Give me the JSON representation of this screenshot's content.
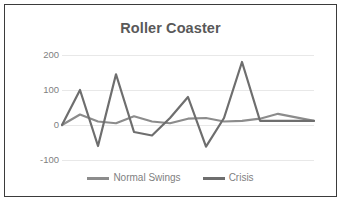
{
  "chart_data": {
    "type": "line",
    "title": "Roller Coaster",
    "xlabel": "",
    "ylabel": "",
    "ylim": [
      -100,
      200
    ],
    "yticks": [
      200,
      100,
      0,
      -100
    ],
    "ytick_labels": [
      "200",
      "100",
      "0",
      "-100"
    ],
    "grid": true,
    "legend_position": "bottom",
    "x": [
      1,
      2,
      3,
      4,
      5,
      6,
      7,
      8,
      9,
      10,
      11,
      12,
      13,
      14,
      15
    ],
    "series": [
      {
        "name": "Normal Swings",
        "color": "#8c8c8c",
        "values": [
          0,
          30,
          10,
          5,
          25,
          10,
          5,
          18,
          20,
          10,
          12,
          18,
          32,
          22,
          12
        ]
      },
      {
        "name": "Crisis",
        "color": "#6e6e6e",
        "values": [
          0,
          100,
          -60,
          145,
          -20,
          -30,
          20,
          80,
          -62,
          20,
          180,
          12,
          12,
          12,
          12
        ]
      }
    ]
  },
  "legend": {
    "entries": [
      {
        "label": "Normal Swings",
        "color": "#8c8c8c"
      },
      {
        "label": "Crisis",
        "color": "#6e6e6e"
      }
    ]
  },
  "colors": {
    "border": "#3b3b3b",
    "gridline": "#e8e8e8",
    "title_text": "#595959",
    "tick_text": "#7f7f7f",
    "background": "#ffffff"
  }
}
